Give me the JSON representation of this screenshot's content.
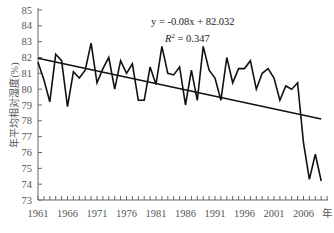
{
  "chart_data": {
    "type": "line",
    "title": "",
    "xlabel": "年",
    "ylabel": "年平均相对湿度(%)",
    "ylim": [
      73,
      85
    ],
    "xlim": [
      1961,
      2010
    ],
    "grid": false,
    "legend": "none",
    "yticks": [
      73,
      74,
      75,
      76,
      77,
      78,
      79,
      80,
      81,
      82,
      83,
      84,
      85
    ],
    "xticks": [
      "1961",
      "1966",
      "1971",
      "1976",
      "1981",
      "1986",
      "1991",
      "1996",
      "2001",
      "2006"
    ],
    "annotations": [
      "y = -0.08x + 82.032",
      "R² = 0.347"
    ],
    "equation_line1": "y = -0.08x + 82.032",
    "equation_line2_prefix": "R",
    "equation_line2_sup": "2",
    "equation_line2_suffix": " = 0.347",
    "x": [
      1961,
      1962,
      1963,
      1964,
      1965,
      1966,
      1967,
      1968,
      1969,
      1970,
      1971,
      1972,
      1973,
      1974,
      1975,
      1976,
      1977,
      1978,
      1979,
      1980,
      1981,
      1982,
      1983,
      1984,
      1985,
      1986,
      1987,
      1988,
      1989,
      1990,
      1991,
      1992,
      1993,
      1994,
      1995,
      1996,
      1997,
      1998,
      1999,
      2000,
      2001,
      2002,
      2003,
      2004,
      2005,
      2006,
      2007,
      2008,
      2009
    ],
    "series": [
      {
        "name": "年平均相对湿度",
        "values": [
          81.7,
          80.6,
          79.2,
          82.2,
          81.8,
          78.9,
          81.1,
          80.7,
          81.2,
          82.9,
          80.4,
          81.3,
          82.0,
          80.0,
          81.8,
          81.0,
          81.6,
          79.3,
          79.3,
          81.4,
          80.3,
          82.7,
          81.0,
          80.9,
          81.4,
          79.0,
          81.2,
          79.3,
          82.7,
          81.2,
          80.7,
          79.3,
          82.0,
          80.4,
          81.3,
          81.3,
          81.8,
          80.0,
          81.0,
          81.3,
          80.7,
          79.3,
          80.2,
          80.0,
          80.4,
          76.6,
          74.3,
          75.9,
          74.2
        ]
      },
      {
        "name": "trend",
        "values_formula": "y = -0.08x + 82.032",
        "start": 81.95,
        "end": 78.11
      }
    ]
  }
}
